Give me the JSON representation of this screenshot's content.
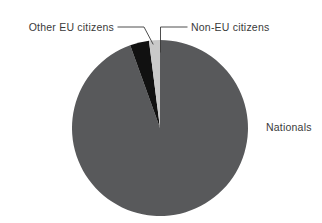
{
  "chart_data": {
    "type": "pie",
    "title": "",
    "subtitle": "",
    "xlabel": "",
    "ylabel": "",
    "legend_position": "none",
    "grid": false,
    "labels_placement": "outside-with-leader-lines",
    "categories": [
      "Nationals",
      "Other EU citizens",
      "Non-EU citizens"
    ],
    "values": [
      94.5,
      3.5,
      2.0
    ],
    "units": "percent",
    "start_angle_deg": -90,
    "direction": "clockwise",
    "slices": [
      {
        "name": "Nationals",
        "label": "Nationals",
        "value": 94.5,
        "color": "#58595b",
        "label_position": "right",
        "has_leader_line": false
      },
      {
        "name": "Other EU citizens",
        "label": "Other EU citizens",
        "value": 3.5,
        "color": "#111111",
        "label_position": "top-left",
        "has_leader_line": true
      },
      {
        "name": "Non-EU citizens",
        "label": "Non-EU citizens",
        "value": 2.0,
        "color": "#c9c9c9",
        "label_position": "top-right",
        "has_leader_line": true
      }
    ]
  },
  "labels": {
    "other_eu": "Other EU citizens",
    "non_eu": "Non-EU citizens",
    "nationals": "Nationals"
  },
  "colors": {
    "nationals": "#58595b",
    "other_eu": "#111111",
    "non_eu": "#c9c9c9",
    "text": "#3a3a3a",
    "leader_line": "#3a3a3a",
    "background": "#ffffff"
  }
}
